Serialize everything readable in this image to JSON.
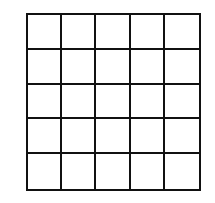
{
  "grid": {
    "rows": 5,
    "cols": 5,
    "line_color": "#111111",
    "cell_color": "#ffffff"
  }
}
